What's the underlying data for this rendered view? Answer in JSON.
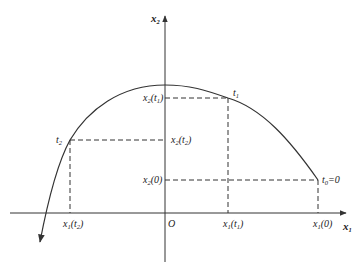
{
  "diagram": {
    "axes": {
      "x_label": "x",
      "x_label_sub": "1",
      "y_label": "x",
      "y_label_sub": "2",
      "origin_label": "O"
    },
    "points": {
      "t0": {
        "name": "t",
        "sub": "0",
        "suffix": "=0"
      },
      "t1": {
        "name": "t",
        "sub": "1"
      },
      "t2": {
        "name": "t",
        "sub": "2"
      }
    },
    "x_ticks": [
      {
        "main": "x",
        "sub": "1",
        "arg_open": "(",
        "arg": "t",
        "arg_sub": "2",
        "arg_close": ")"
      },
      {
        "main": "x",
        "sub": "1",
        "arg_open": "(",
        "arg": "t",
        "arg_sub": "1",
        "arg_close": ")"
      },
      {
        "main": "x",
        "sub": "1",
        "arg": "(0)"
      }
    ],
    "y_ticks": [
      {
        "main": "x",
        "sub": "2",
        "arg_open": "(",
        "arg": "t",
        "arg_sub": "1",
        "arg_close": ")"
      },
      {
        "main": "x",
        "sub": "2",
        "arg_open": "(",
        "arg": "t",
        "arg_sub": "2",
        "arg_close": ")"
      },
      {
        "main": "x",
        "sub": "2",
        "arg": "(0)"
      }
    ],
    "colors": {
      "stroke": "#333333",
      "text": "#222222"
    }
  }
}
